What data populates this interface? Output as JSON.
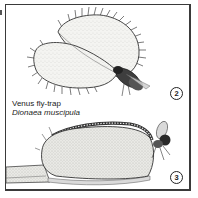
{
  "figure": {
    "caption": {
      "common_name": "Venus fly-trap",
      "scientific_name": "Dionaea muscipula"
    },
    "panels": [
      {
        "label": "2",
        "description": "open trap lobes with fly landing",
        "icon": "venus-flytrap-open-icon"
      },
      {
        "label": "3",
        "description": "closed trap with fly caught",
        "icon": "venus-flytrap-closed-icon"
      }
    ],
    "colors": {
      "ink": "#222222",
      "frame": "#3a3a3a",
      "leaf_fill": "#f1f1ee",
      "background": "#ffffff"
    }
  }
}
